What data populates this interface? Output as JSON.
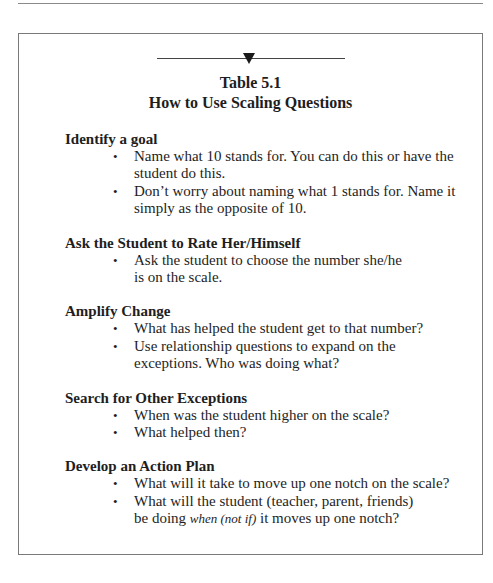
{
  "table": {
    "number": "Table 5.1",
    "title": "How to Use Scaling Questions",
    "sections": [
      {
        "heading": "Identify a goal",
        "bullets": [
          "Name what 10 stands for. You can do this or have the student do this.",
          "Don’t worry about naming what 1 stands for. Name it simply as the opposite of 10."
        ]
      },
      {
        "heading": "Ask the Student to Rate Her/Himself",
        "bullets": [
          "Ask the student to choose the number she/he is on the scale."
        ]
      },
      {
        "heading": "Amplify Change",
        "bullets": [
          "What has helped the student get to that number?",
          "Use relationship questions to expand on the exceptions. Who was doing what?"
        ]
      },
      {
        "heading": "Search for Other Exceptions",
        "bullets": [
          "When was the student higher on the scale?",
          "What helped then?"
        ]
      },
      {
        "heading": "Develop an Action Plan",
        "bullets": [
          "What will it take to move up one notch on the scale?",
          "What will the student (teacher, parent, friends) be doing"
        ],
        "last_bullet_italic": "when (not if)",
        "last_bullet_tail": "it moves up one notch?"
      }
    ]
  },
  "bullet_glyph": "•"
}
